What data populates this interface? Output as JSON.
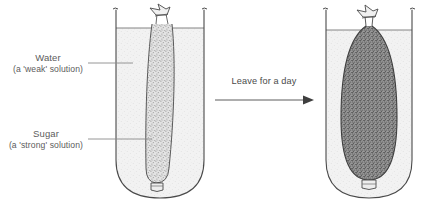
{
  "figure": {
    "type": "science-diagram"
  },
  "labels": {
    "water": {
      "line1": "Water",
      "line2": "(a 'weak' solution)"
    },
    "sugar": {
      "line1": "Sugar",
      "line2": "(a 'strong' solution)"
    },
    "arrow": "Leave for a day"
  },
  "colors": {
    "outline": "#4a4a4a",
    "text": "#5c5c5c",
    "water_fill": "#f1f1f1",
    "bag_fill_before": "#cfcfcf",
    "bag_fill_after": "#8d8d8d",
    "leader_line": "#8a8a8a"
  },
  "stages": {
    "before": {
      "bag_state": "narrow",
      "beaker": "left"
    },
    "after": {
      "bag_state": "swollen",
      "beaker": "right"
    }
  }
}
